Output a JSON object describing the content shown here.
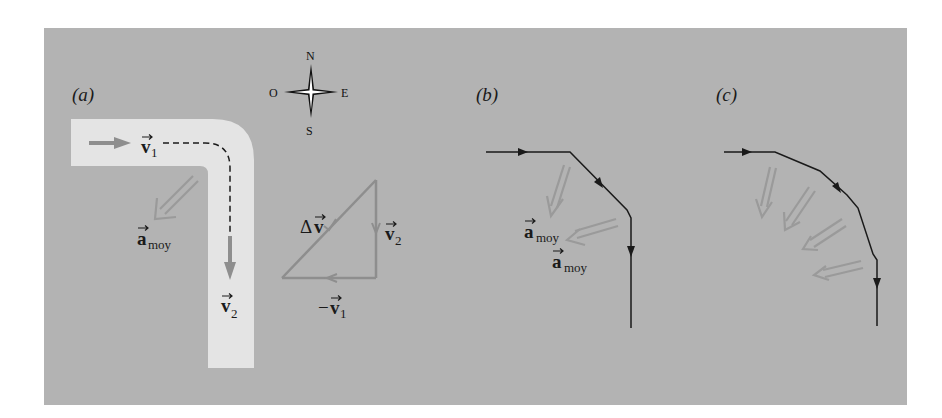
{
  "colors": {
    "panel_background": "#b3b3b3",
    "road": "#e4e4e4",
    "gray_arrow": "#8e8e8e",
    "path_line": "#1a1a1a"
  },
  "panels": {
    "a": {
      "label": "(a)",
      "compass": {
        "north": "N",
        "south": "S",
        "west": "O",
        "east": "E"
      },
      "v1": {
        "symbol": "v",
        "subscript": "1"
      },
      "v2": {
        "symbol": "v",
        "subscript": "2"
      },
      "a_avg": {
        "symbol": "a",
        "subscript": "moy"
      },
      "triangle": {
        "delta_v": {
          "prefix": "Δ",
          "symbol": "v"
        },
        "v2": {
          "symbol": "v",
          "subscript": "2"
        },
        "neg_v1": {
          "prefix": "−",
          "symbol": "v",
          "subscript": "1"
        }
      }
    },
    "b": {
      "label": "(b)",
      "a_avg_1": {
        "symbol": "a",
        "subscript": "moy"
      },
      "a_avg_2": {
        "symbol": "a",
        "subscript": "moy"
      }
    },
    "c": {
      "label": "(c)",
      "acceleration_arrow_count": 4
    }
  }
}
